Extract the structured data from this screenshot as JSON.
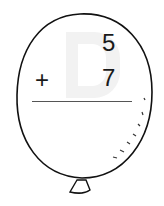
{
  "problem": {
    "top_number": "5",
    "operator": "+",
    "bottom_number": "7",
    "answer": ""
  },
  "watermark": "D",
  "shape": "balloon"
}
